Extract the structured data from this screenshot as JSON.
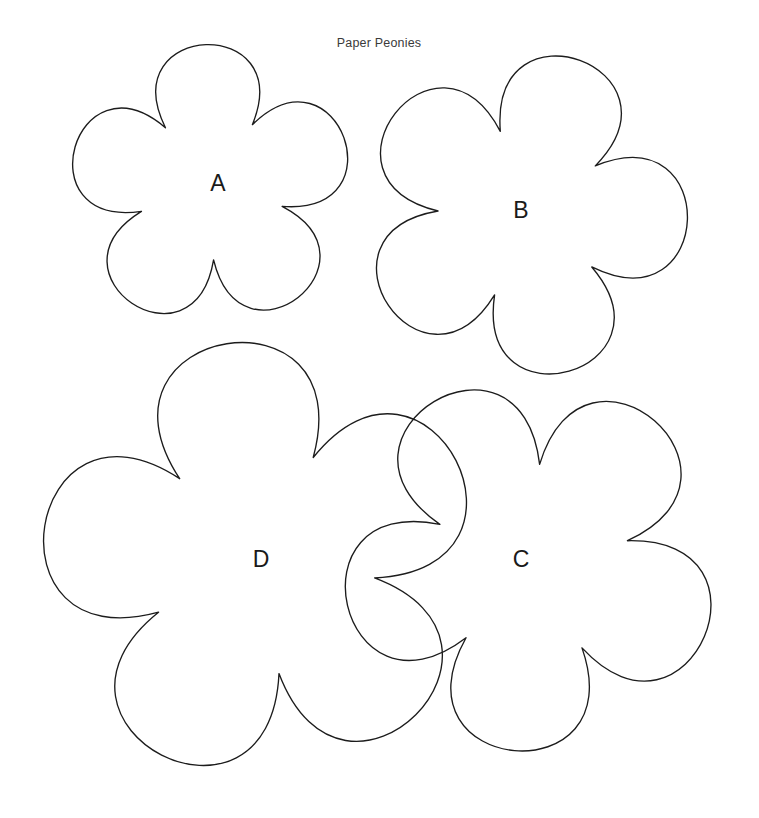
{
  "page": {
    "title": "Paper Peonies",
    "title_position": {
      "x": 379,
      "y": 44
    },
    "background_color": "#ffffff",
    "stroke_color": "#1c1c1c",
    "label_color": "#1a1a1a",
    "width": 759,
    "height": 818
  },
  "templates": [
    {
      "label": "A",
      "label_position": {
        "x": 218,
        "y": 185
      },
      "center": {
        "x": 211,
        "y": 186
      },
      "outer_radius": 148,
      "inner_radius": 74,
      "petals": 5,
      "rotation_deg": -2
    },
    {
      "label": "B",
      "label_position": {
        "x": 521,
        "y": 212
      },
      "center": {
        "x": 524,
        "y": 214
      },
      "outer_radius": 171,
      "inner_radius": 86,
      "petals": 5,
      "rotation_deg": 20
    },
    {
      "label": "C",
      "label_position": {
        "x": 521,
        "y": 561
      },
      "center": {
        "x": 531,
        "y": 563
      },
      "outer_radius": 197,
      "inner_radius": 99,
      "petals": 5,
      "rotation_deg": -103
    },
    {
      "label": "D",
      "label_position": {
        "x": 261,
        "y": 561
      },
      "center": {
        "x": 261,
        "y": 560
      },
      "outer_radius": 229,
      "inner_radius": 115,
      "petals": 5,
      "rotation_deg": -9
    }
  ]
}
